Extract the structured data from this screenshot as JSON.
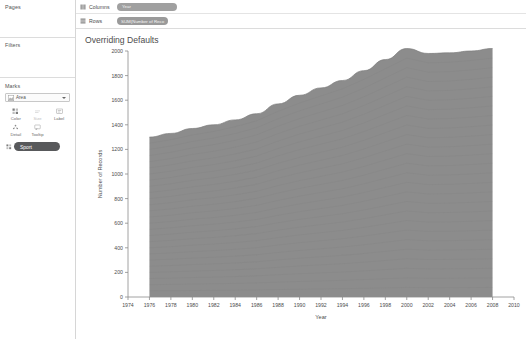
{
  "sidebar": {
    "pages": {
      "title": "Pages"
    },
    "filters": {
      "title": "Filters"
    },
    "marks": {
      "title": "Marks",
      "mark_type": "Area",
      "mark_type_icon": "area-mark-icon",
      "buttons": [
        {
          "label": "Color",
          "icon": "color-icon",
          "disabled": false
        },
        {
          "label": "Size",
          "icon": "size-icon",
          "disabled": true
        },
        {
          "label": "Label",
          "icon": "label-icon",
          "disabled": false
        },
        {
          "label": "Detail",
          "icon": "detail-icon",
          "disabled": false
        },
        {
          "label": "Tooltip",
          "icon": "tooltip-icon",
          "disabled": false
        }
      ],
      "encoding_pills": [
        {
          "label": "Sport",
          "icon": "color-icon",
          "color": "#58595b"
        }
      ]
    }
  },
  "shelves": [
    {
      "name": "Columns",
      "icon": "columns-icon",
      "pill": "Year",
      "pill_kind": "green"
    },
    {
      "name": "Rows",
      "icon": "rows-icon",
      "pill": "SUM(Number of Reco",
      "pill_kind": "blue"
    }
  ],
  "viz": {
    "title": "Overriding Defaults"
  },
  "colors": {
    "area_fill": "#8c8c8c",
    "area_stroke": "#7d7d7d",
    "axis": "#8a8a8a",
    "text": "#4d4d4d",
    "pill_dark": "#58595b"
  },
  "chart_data": {
    "type": "area",
    "title": "Overriding Defaults",
    "xlabel": "Year",
    "ylabel": "Number of Records",
    "xlim": [
      1974,
      2010
    ],
    "ylim": [
      0,
      2000
    ],
    "grid": false,
    "legend": "none",
    "xticks": [
      1974,
      1976,
      1978,
      1980,
      1982,
      1984,
      1986,
      1988,
      1990,
      1992,
      1994,
      1996,
      1998,
      2000,
      2002,
      2004,
      2006,
      2008,
      2010
    ],
    "yticks": [
      0,
      200,
      400,
      600,
      800,
      1000,
      1200,
      1400,
      1600,
      1800,
      2000
    ],
    "note": "Stacked area of Number of Records by Year, coloured by Sport (many thin strata rendered as one grey mass).",
    "series": [
      {
        "name": "SUM(Number of Records)",
        "x": [
          1976,
          1978,
          1980,
          1982,
          1984,
          1986,
          1988,
          1990,
          1992,
          1994,
          1996,
          1998,
          2000,
          2002,
          2004,
          2006,
          2008
        ],
        "values": [
          1300,
          1330,
          1370,
          1400,
          1440,
          1490,
          1570,
          1640,
          1700,
          1760,
          1840,
          1930,
          2020,
          1980,
          1985,
          2000,
          2020
        ]
      }
    ]
  }
}
